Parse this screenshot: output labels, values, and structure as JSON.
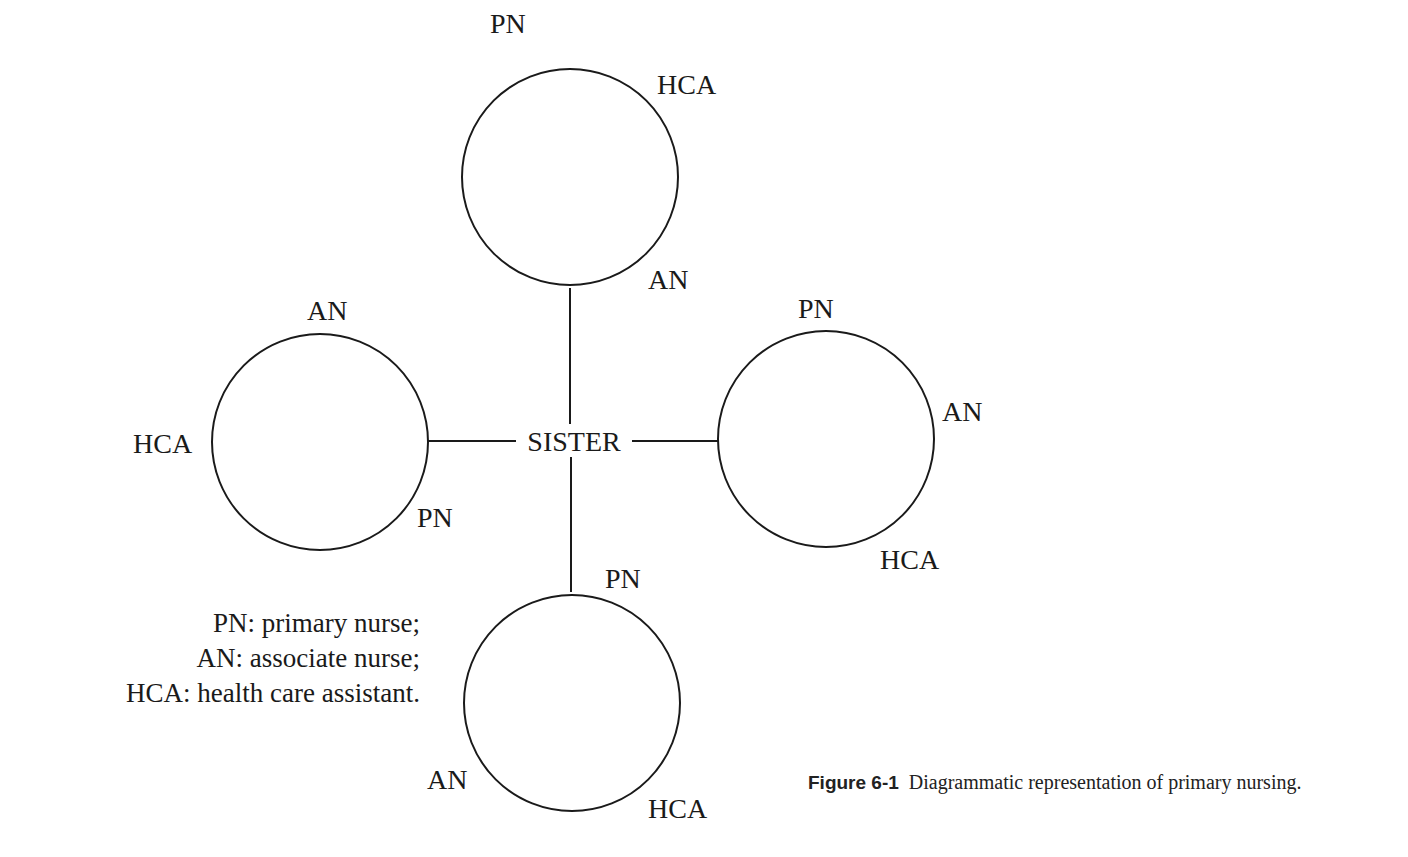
{
  "diagram": {
    "center_node": {
      "label": "SISTER"
    },
    "teams": [
      {
        "position": "top",
        "labels": [
          {
            "text": "PN",
            "x": 490,
            "y": 33
          },
          {
            "text": "HCA",
            "x": 657,
            "y": 94
          },
          {
            "text": "AN",
            "x": 648,
            "y": 289
          }
        ]
      },
      {
        "position": "left",
        "labels": [
          {
            "text": "AN",
            "x": 307,
            "y": 320
          },
          {
            "text": "HCA",
            "x": 133,
            "y": 453
          },
          {
            "text": "PN",
            "x": 417,
            "y": 527
          }
        ]
      },
      {
        "position": "right",
        "labels": [
          {
            "text": "PN",
            "x": 798,
            "y": 318
          },
          {
            "text": "AN",
            "x": 942,
            "y": 421
          },
          {
            "text": "HCA",
            "x": 880,
            "y": 569
          }
        ]
      },
      {
        "position": "bottom",
        "labels": [
          {
            "text": "PN",
            "x": 605,
            "y": 588
          },
          {
            "text": "AN",
            "x": 427,
            "y": 789
          },
          {
            "text": "HCA",
            "x": 648,
            "y": 818
          }
        ]
      }
    ],
    "stroke_color": "#1a1a1a"
  },
  "legend": {
    "items": [
      "PN: primary nurse;",
      "AN: associate nurse;",
      "HCA: health care assistant."
    ]
  },
  "caption": {
    "figure_number": "Figure 6-1",
    "text": "Diagrammatic representation of primary nursing."
  }
}
